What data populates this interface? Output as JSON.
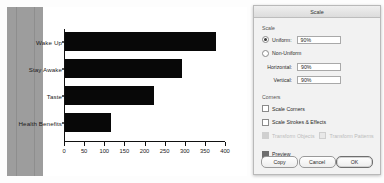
{
  "chart_data": {
    "type": "bar",
    "orientation": "horizontal",
    "title": "",
    "xlabel": "",
    "ylabel": "",
    "categories": [
      "Wake Up",
      "Stay Awake",
      "Taste",
      "Health Benefits"
    ],
    "values": [
      375,
      290,
      220,
      115
    ],
    "xlim": [
      0,
      400
    ],
    "xticks": [
      0,
      50,
      100,
      150,
      200,
      250,
      300,
      350,
      400
    ],
    "xtick_labels": [
      "0",
      "50",
      "100",
      "150",
      "200",
      "250",
      "300",
      "350",
      "400"
    ],
    "grid": false,
    "legend": null,
    "bar_color": "#080808",
    "plot_background": "#ffffff"
  },
  "artboard": {
    "band_color": "#9d9d9d"
  },
  "dialog": {
    "title": "Scale",
    "scale_section": {
      "heading": "Scale",
      "uniform_label": "Uniform:",
      "uniform_value": "90%",
      "uniform_selected": true,
      "nonuniform_label": "Non-Uniform",
      "nonuniform_selected": false,
      "horizontal_label": "Horizontal:",
      "horizontal_value": "90%",
      "vertical_label": "Vertical:",
      "vertical_value": "90%"
    },
    "options_section": {
      "heading": "Corners",
      "scale_corners_label": "Scale Corners",
      "scale_corners_checked": false,
      "scale_strokes_label": "Scale Strokes & Effects",
      "scale_strokes_checked": false,
      "transform_objects_label": "Transform Objects",
      "transform_objects_checked": true,
      "transform_objects_disabled": true,
      "transform_patterns_label": "Transform Patterns",
      "transform_patterns_checked": false,
      "transform_patterns_disabled": true
    },
    "preview_label": "Preview",
    "preview_checked": true,
    "buttons": {
      "copy": "Copy",
      "cancel": "Cancel",
      "ok": "OK"
    }
  }
}
